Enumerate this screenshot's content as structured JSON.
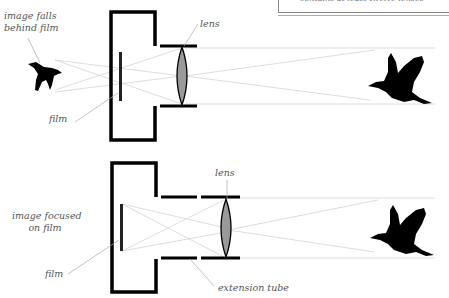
{
  "callout": {
    "text": "contains at least twelve lenses"
  },
  "top_diagram": {
    "label_image": "image falls\nbehind film",
    "label_image_line1": "image falls",
    "label_image_line2": "behind film",
    "label_film": "film",
    "label_lens": "lens"
  },
  "bottom_diagram": {
    "label_image_line1": "image focused",
    "label_image_line2": "on film",
    "label_film": "film",
    "label_lens": "lens",
    "label_tube": "extension tube"
  },
  "colors": {
    "body": "#000000",
    "lens_fill": "#9a9a9a",
    "ray": "#cfcfcf",
    "leader": "#aaaaaa",
    "label": "#555555"
  }
}
